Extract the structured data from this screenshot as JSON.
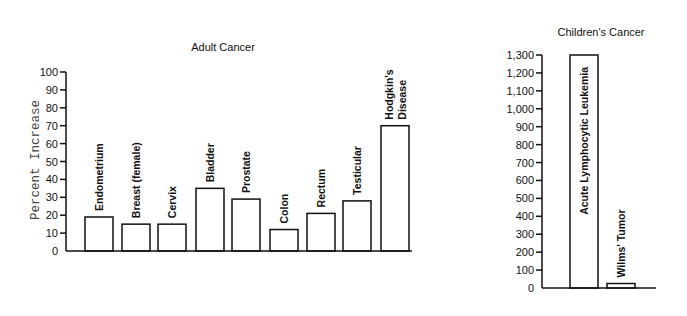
{
  "chart_data": [
    {
      "type": "bar",
      "title": "Adult Cancer",
      "xlabel": "",
      "ylabel": "Percent Increase",
      "ylim": [
        0,
        100
      ],
      "yticks": [
        0,
        10,
        20,
        30,
        40,
        50,
        60,
        70,
        80,
        90,
        100
      ],
      "ytick_labels": [
        "0",
        "10",
        "20",
        "30",
        "40",
        "50",
        "60",
        "70",
        "80",
        "90",
        "100"
      ],
      "grid": false,
      "categories": [
        "Endometrium",
        "Breast (female)",
        "Cervix",
        "Bladder",
        "Prostate",
        "Colon",
        "Rectum",
        "Testicular",
        "Hodgkin's Disease"
      ],
      "category_label_lines": [
        [
          "Endometrium"
        ],
        [
          "Breast (female)"
        ],
        [
          "Cervix"
        ],
        [
          "Bladder"
        ],
        [
          "Prostate"
        ],
        [
          "Colon"
        ],
        [
          "Rectum"
        ],
        [
          "Testicular"
        ],
        [
          "Hodgkin's",
          "Disease"
        ]
      ],
      "values": [
        19,
        15,
        15,
        35,
        29,
        12,
        21,
        28,
        70
      ],
      "label_position": "above-bar-rotated"
    },
    {
      "type": "bar",
      "title": "Children's Cancer",
      "xlabel": "",
      "ylabel": "",
      "ylim": [
        0,
        1300
      ],
      "yticks": [
        0,
        100,
        200,
        300,
        400,
        500,
        600,
        700,
        800,
        900,
        1000,
        1100,
        1200,
        1300
      ],
      "ytick_labels": [
        "0",
        "100",
        "200",
        "300",
        "400",
        "500",
        "600",
        "700",
        "800",
        "900",
        "1,000",
        "1,100",
        "1,200",
        "1,300"
      ],
      "grid": false,
      "categories": [
        "Acute Lymphocytic Leukemia",
        "Wilms' Tumor"
      ],
      "values": [
        1300,
        25
      ],
      "label_position": "rotated (inside tall bar / above short bar)"
    }
  ],
  "layout": {
    "adult": {
      "axis_x": 66,
      "baseline_y": 251,
      "top_y": 72,
      "x_end": 412,
      "bar_x": [
        85,
        122,
        158,
        196,
        232,
        270,
        307,
        343,
        381
      ],
      "bar_w": 28,
      "title_x": 223,
      "title_y": 51,
      "ylabel_x": 39,
      "ylabel_y": 160
    },
    "children": {
      "axis_x": 542,
      "baseline_y": 288,
      "top_y": 55,
      "x_end": 656,
      "bar_x": [
        570,
        607
      ],
      "bar_w": 28,
      "title_x": 601,
      "title_y": 36
    }
  }
}
